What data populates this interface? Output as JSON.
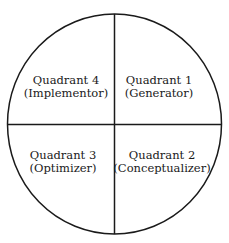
{
  "diagram": {
    "type": "quadrant-circle",
    "colors": {
      "stroke": "#1a1a1a",
      "fill": "#ffffff",
      "text": "#1a1a1a"
    },
    "quadrants": [
      {
        "id": 4,
        "title": "Quadrant 4",
        "subtitle": "(Implementor)",
        "position": "top-left"
      },
      {
        "id": 1,
        "title": "Quadrant 1",
        "subtitle": "(Generator)",
        "position": "top-right"
      },
      {
        "id": 3,
        "title": "Quadrant 3",
        "subtitle": "(Optimizer)",
        "position": "bottom-left"
      },
      {
        "id": 2,
        "title": "Quadrant 2",
        "subtitle": "(Conceptualizer)",
        "position": "bottom-right"
      }
    ]
  }
}
